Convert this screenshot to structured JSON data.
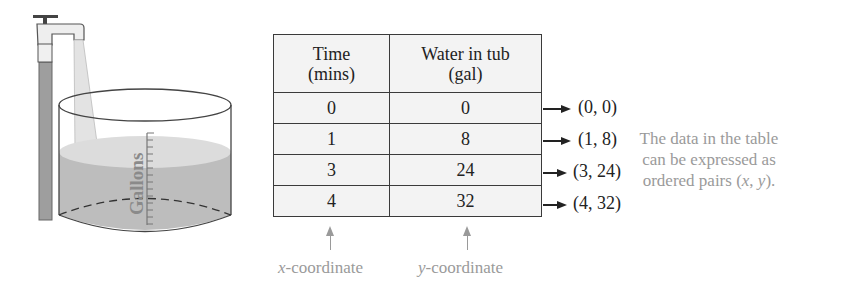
{
  "illustration": {
    "label": "Gallons"
  },
  "table": {
    "headers": [
      {
        "line1": "Time",
        "line2": "(mins)"
      },
      {
        "line1": "Water in tub",
        "line2": "(gal)"
      }
    ],
    "rows": [
      {
        "time": "0",
        "water": "0",
        "pair": "(0, 0)"
      },
      {
        "time": "1",
        "water": "8",
        "pair": "(1, 8)"
      },
      {
        "time": "3",
        "water": "24",
        "pair": "(3, 24)"
      },
      {
        "time": "4",
        "water": "32",
        "pair": "(4, 32)"
      }
    ]
  },
  "note": {
    "line1": "The data in the table",
    "line2": "can be expressed as",
    "line3_prefix": "ordered pairs (",
    "x": "x",
    "sep": ", ",
    "y": "y",
    "line3_suffix": ")."
  },
  "axes_labels": {
    "x_var": "x",
    "x_rest": "-coordinate",
    "y_var": "y",
    "y_rest": "-coordinate"
  },
  "colors": {
    "water": "#bdbdbd",
    "table_bg": "#f3f3f3",
    "note_text": "#9a9a9a"
  }
}
